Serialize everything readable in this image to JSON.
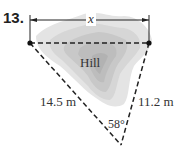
{
  "problem_number": "13.",
  "labels": {
    "top_distance": "x",
    "region": "Hill",
    "left_side": "14.5 m",
    "right_side": "11.2 m",
    "angle": "58°"
  },
  "colors": {
    "hill_light": "#e2e2e2",
    "hill_mid": "#cfcfcf",
    "hill_dark": "#b8b8b8",
    "lines": "#222222"
  }
}
